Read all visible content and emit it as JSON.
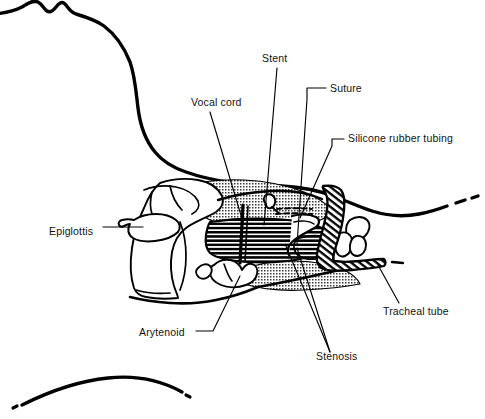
{
  "figure": {
    "type": "anatomical-line-diagram",
    "background_color": "#ffffff",
    "line_color": "#000000",
    "text_color": "#111111"
  },
  "labels": [
    {
      "id": "stent",
      "text": "Stent",
      "x": 262,
      "y": 62,
      "anchor": "start"
    },
    {
      "id": "suture",
      "text": "Suture",
      "x": 330,
      "y": 92,
      "anchor": "start"
    },
    {
      "id": "vocal_cord",
      "text": "Vocal cord",
      "x": 191,
      "y": 106,
      "anchor": "start"
    },
    {
      "id": "silicone_tubing",
      "text": "Silicone rubber tubing",
      "x": 348,
      "y": 142,
      "anchor": "start"
    },
    {
      "id": "epiglottis",
      "text": "Epiglottis",
      "x": 49,
      "y": 235,
      "anchor": "start"
    },
    {
      "id": "tracheal_tube",
      "text": "Tracheal tube",
      "x": 383,
      "y": 315,
      "anchor": "start"
    },
    {
      "id": "arytenoid",
      "text": "Arytenoid",
      "x": 139,
      "y": 336,
      "anchor": "start"
    },
    {
      "id": "stenosis",
      "text": "Stenosis",
      "x": 316,
      "y": 360,
      "anchor": "start"
    }
  ],
  "leader_lines": [
    {
      "id": "leader-stent",
      "for": "stent",
      "d": "M 277 68 L 264 225"
    },
    {
      "id": "leader-suture",
      "for": "suture",
      "d": "M 326 88 L 307 88 L 307 99 L 297 245"
    },
    {
      "id": "leader-vocal-cord",
      "for": "vocal_cord",
      "d": "M 210 112 L 243 222"
    },
    {
      "id": "leader-silicone",
      "for": "silicone_tubing",
      "d": "M 344 139 L 332 139 L 332 146 L 300 218"
    },
    {
      "id": "leader-epiglottis",
      "for": "epiglottis",
      "d": "M 103 227 L 143 227"
    },
    {
      "id": "leader-tracheal-tube",
      "for": "tracheal_tube",
      "d": "M 399 303 L 378 265"
    },
    {
      "id": "leader-arytenoid",
      "for": "arytenoid",
      "d": "M 196 331 L 213 331 L 240 276"
    },
    {
      "id": "leader-stenosis-a",
      "for": "stenosis",
      "d": "M 330 352 L 286 246"
    },
    {
      "id": "leader-stenosis-b",
      "for": "stenosis",
      "d": "M 330 352 L 297 248"
    }
  ],
  "anatomy_parts": [
    {
      "id": "head-profile-outline",
      "name": "head and neck profile outline"
    },
    {
      "id": "chest-arc-outline",
      "name": "chest arc outline"
    },
    {
      "id": "thyroid-cartilage",
      "name": "thyroid cartilage"
    },
    {
      "id": "epiglottis-cartilage",
      "name": "epiglottis cartilage"
    },
    {
      "id": "arytenoid-cartilage",
      "name": "arytenoid cartilage"
    },
    {
      "id": "cricoid-cartilage",
      "name": "cricoid cartilage"
    },
    {
      "id": "stenosis-hatched-mass",
      "name": "stenosis hatched mass"
    },
    {
      "id": "stippled-mucosa",
      "name": "stippled mucosa"
    },
    {
      "id": "tracheal-tube-body",
      "name": "tracheal tube hatched body"
    },
    {
      "id": "silicone-rubber-tubing",
      "name": "silicone rubber tubing"
    },
    {
      "id": "stent-rod",
      "name": "stent rod"
    },
    {
      "id": "suture-knot",
      "name": "suture knot"
    },
    {
      "id": "suture-stitches",
      "name": "suture dashed stitches"
    },
    {
      "id": "airway-upper-wall",
      "name": "upper airway wall"
    },
    {
      "id": "airway-lower-wall",
      "name": "lower airway wall"
    }
  ]
}
